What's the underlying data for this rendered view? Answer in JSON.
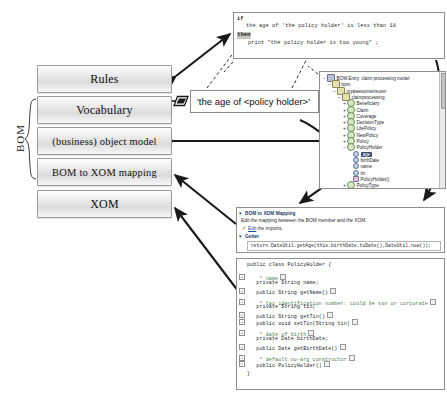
{
  "stack": {
    "bracket_label": "BOM",
    "layers": [
      {
        "id": "rules",
        "label": "Rules"
      },
      {
        "id": "vocabulary",
        "label": "Vocabulary"
      },
      {
        "id": "object-model",
        "label": "(business) object model"
      },
      {
        "id": "bom-to-xom",
        "label": "BOM to XOM mapping"
      },
      {
        "id": "xom",
        "label": "XOM"
      }
    ]
  },
  "rule_editor": {
    "keyword_if": "if",
    "condition": "the age of 'the policy holder' is less than 18",
    "keyword_then": "then",
    "action": "print \"the policy holder is too young\" ;"
  },
  "vocabulary_callout": {
    "text": "'the age of <policy holder>'",
    "marker_icon": "parallelogram-icon"
  },
  "bom_tree": {
    "rows": [
      {
        "indent": 0,
        "twisty": "−",
        "icon": "model-icon",
        "label": "BOM Entry: claim processing model",
        "selected": false
      },
      {
        "indent": 1,
        "twisty": "−",
        "icon": "package-icon",
        "label": "bom",
        "selected": false
      },
      {
        "indent": 2,
        "twisty": "−",
        "icon": "package-icon",
        "label": "myawesomeinsurer",
        "selected": false
      },
      {
        "indent": 3,
        "twisty": "−",
        "icon": "package-icon",
        "label": "claimprocessing",
        "selected": false
      },
      {
        "indent": 4,
        "twisty": "+",
        "icon": "class-icon",
        "label": "Beneficiary",
        "selected": false
      },
      {
        "indent": 4,
        "twisty": "+",
        "icon": "class-icon",
        "label": "Claim",
        "selected": false
      },
      {
        "indent": 4,
        "twisty": "+",
        "icon": "class-icon",
        "label": "Coverage",
        "selected": false
      },
      {
        "indent": 4,
        "twisty": "+",
        "icon": "class-icon",
        "label": "DecisionType",
        "selected": false
      },
      {
        "indent": 4,
        "twisty": "+",
        "icon": "class-icon",
        "label": "LifePolicy",
        "selected": false
      },
      {
        "indent": 4,
        "twisty": "+",
        "icon": "class-icon",
        "label": "NewPolicy",
        "selected": false
      },
      {
        "indent": 4,
        "twisty": "+",
        "icon": "class-icon",
        "label": "Policy",
        "selected": false
      },
      {
        "indent": 4,
        "twisty": "−",
        "icon": "class-icon",
        "label": "PolicyHolder",
        "selected": false
      },
      {
        "indent": 5,
        "twisty": "",
        "icon": "attribute-icon",
        "label": "age",
        "selected": true
      },
      {
        "indent": 5,
        "twisty": "",
        "icon": "attribute-icon",
        "label": "birthDate",
        "selected": false
      },
      {
        "indent": 5,
        "twisty": "",
        "icon": "attribute-icon",
        "label": "name",
        "selected": false
      },
      {
        "indent": 5,
        "twisty": "",
        "icon": "attribute-icon",
        "label": "tin",
        "selected": false
      },
      {
        "indent": 5,
        "twisty": "",
        "icon": "constructor-icon",
        "label": "PolicyHolder()",
        "selected": false
      },
      {
        "indent": 4,
        "twisty": "+",
        "icon": "class-icon",
        "label": "PolicyType",
        "selected": false
      }
    ]
  },
  "mapping_panel": {
    "title": "BOM to XOM Mapping",
    "description": "Edit the mapping between the BOM member and the XOM.",
    "imports_prefix": "",
    "imports_link": "Edit",
    "imports_suffix": " the imports.",
    "getter_title": "Getter",
    "code": "return DateUtil.getAge(this.birthDate.toDate(),DateUtil.now());",
    "edit_icon": "pencil-icon",
    "twisty_title": "▾",
    "twisty_getter": "▾"
  },
  "xom_source": {
    "lines": [
      {
        "text": "public class PolicyHolder {",
        "comment": false,
        "fold": false,
        "box": false
      },
      {
        "text": "",
        "comment": false,
        "fold": false,
        "box": false
      },
      {
        "text": "    * name",
        "comment": true,
        "fold": true,
        "box": true
      },
      {
        "text": "   private String name;",
        "comment": false,
        "fold": false,
        "box": false
      },
      {
        "text": "   public String getName()",
        "comment": false,
        "fold": true,
        "box": true
      },
      {
        "text": "",
        "comment": false,
        "fold": false,
        "box": false
      },
      {
        "text": "    * tax identification number: could be ssn or corporate",
        "comment": true,
        "fold": true,
        "box": true
      },
      {
        "text": "   private String tin;",
        "comment": false,
        "fold": false,
        "box": false
      },
      {
        "text": "   public String getTin()",
        "comment": false,
        "fold": true,
        "box": true
      },
      {
        "text": "   public void setTin(String tin)",
        "comment": false,
        "fold": true,
        "box": true
      },
      {
        "text": "",
        "comment": false,
        "fold": false,
        "box": false
      },
      {
        "text": "    * date of birth",
        "comment": true,
        "fold": true,
        "box": true
      },
      {
        "text": "   private Date birthDate;",
        "comment": false,
        "fold": false,
        "box": false
      },
      {
        "text": "   public Date getBirthDate()",
        "comment": false,
        "fold": true,
        "box": true
      },
      {
        "text": "",
        "comment": false,
        "fold": false,
        "box": false
      },
      {
        "text": "    * default no-arg constructor",
        "comment": true,
        "fold": true,
        "box": true
      },
      {
        "text": "   public PolicyHolder()",
        "comment": false,
        "fold": true,
        "box": true
      },
      {
        "text": "",
        "comment": false,
        "fold": false,
        "box": false
      },
      {
        "text": "}",
        "comment": false,
        "fold": false,
        "box": false
      }
    ]
  },
  "colors": {
    "panel_border": "#8f8f8f",
    "card_border": "#9a9a9a",
    "arrow": "#1a1a1a",
    "selection": "#3a4a6b",
    "link": "#1b4f9c",
    "comment": "#4f7a4f"
  }
}
